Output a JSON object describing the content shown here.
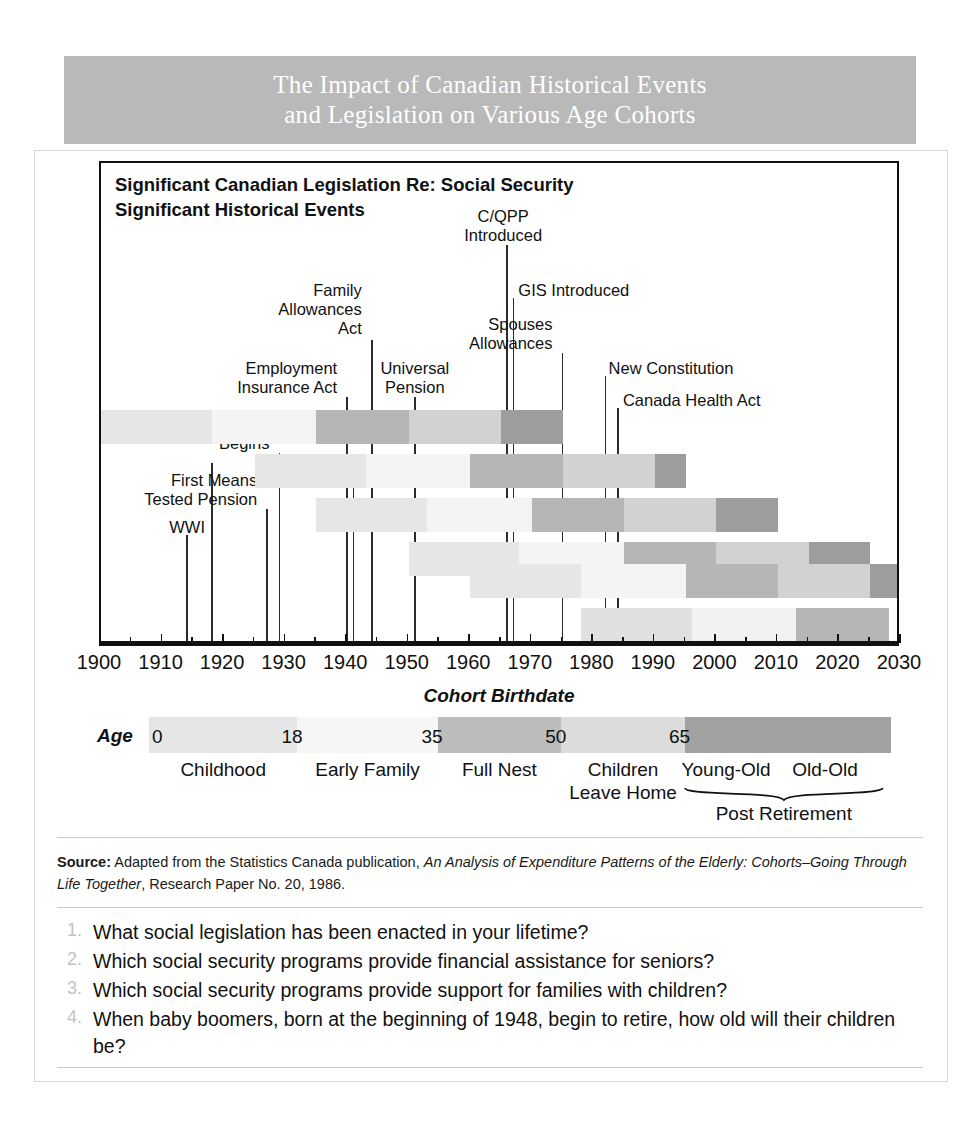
{
  "banner": {
    "line1": "The Impact of Canadian Historical Events",
    "line2": "and Legislation on Various Age Cohorts",
    "bg_color": "#b9b9b9"
  },
  "legend_heading": {
    "line1": "Significant Canadian Legislation Re: Social Security",
    "line2": "Significant Historical Events"
  },
  "chart_data": {
    "type": "bar",
    "title": "The Impact of Canadian Historical Events and Legislation on Various Age Cohorts",
    "xlabel": "Cohort Birthdate",
    "ylabel": "",
    "xlim": [
      1900,
      2030
    ],
    "xticks": [
      1900,
      1910,
      1920,
      1930,
      1940,
      1950,
      1960,
      1970,
      1980,
      1990,
      2000,
      2010,
      2020,
      2030
    ],
    "xticklabels": [
      "1900",
      "1910",
      "1920",
      "1930",
      "1940",
      "1950",
      "1960",
      "1970",
      "1980",
      "1990",
      "2000",
      "2010",
      "2020",
      "2030"
    ],
    "grid": false,
    "legend_position": "below-axis",
    "cohorts": [
      {
        "birth_year": 1900,
        "row": 5,
        "segments": [
          {
            "stage": "Childhood",
            "start": 1900,
            "end": 1918,
            "color": "#e6e6e6"
          },
          {
            "stage": "Early Family",
            "start": 1918,
            "end": 1935,
            "color": "#f4f4f4"
          },
          {
            "stage": "Full Nest",
            "start": 1935,
            "end": 1950,
            "color": "#b6b6b6"
          },
          {
            "stage": "Children Leave Home",
            "start": 1950,
            "end": 1965,
            "color": "#d2d2d2"
          },
          {
            "stage": "Young-Old",
            "start": 1965,
            "end": 1975,
            "color": "#9d9d9d"
          }
        ]
      },
      {
        "birth_year": 1925,
        "row": 4,
        "segments": [
          {
            "stage": "Childhood",
            "start": 1925,
            "end": 1943,
            "color": "#e6e6e6"
          },
          {
            "stage": "Early Family",
            "start": 1943,
            "end": 1960,
            "color": "#f4f4f4"
          },
          {
            "stage": "Full Nest",
            "start": 1960,
            "end": 1975,
            "color": "#b6b6b6"
          },
          {
            "stage": "Children Leave Home",
            "start": 1975,
            "end": 1990,
            "color": "#d2d2d2"
          },
          {
            "stage": "Young-Old",
            "start": 1990,
            "end": 1995,
            "color": "#9d9d9d"
          }
        ]
      },
      {
        "birth_year": 1935,
        "row": 3,
        "segments": [
          {
            "stage": "Childhood",
            "start": 1935,
            "end": 1953,
            "color": "#e6e6e6"
          },
          {
            "stage": "Early Family",
            "start": 1953,
            "end": 1970,
            "color": "#f4f4f4"
          },
          {
            "stage": "Full Nest",
            "start": 1970,
            "end": 1985,
            "color": "#b6b6b6"
          },
          {
            "stage": "Children Leave Home",
            "start": 1985,
            "end": 2000,
            "color": "#d2d2d2"
          },
          {
            "stage": "Young-Old",
            "start": 2000,
            "end": 2010,
            "color": "#9d9d9d"
          }
        ]
      },
      {
        "birth_year": 1950,
        "row": 2,
        "segments": [
          {
            "stage": "Childhood",
            "start": 1950,
            "end": 1968,
            "color": "#e6e6e6"
          },
          {
            "stage": "Early Family",
            "start": 1968,
            "end": 1985,
            "color": "#f4f4f4"
          },
          {
            "stage": "Full Nest",
            "start": 1985,
            "end": 2000,
            "color": "#b6b6b6"
          },
          {
            "stage": "Children Leave Home",
            "start": 2000,
            "end": 2015,
            "color": "#d2d2d2"
          },
          {
            "stage": "Young-Old",
            "start": 2015,
            "end": 2025,
            "color": "#9d9d9d"
          }
        ]
      },
      {
        "birth_year": 1960,
        "row": 1,
        "segments": [
          {
            "stage": "Childhood",
            "start": 1960,
            "end": 1978,
            "color": "#e6e6e6"
          },
          {
            "stage": "Early Family",
            "start": 1978,
            "end": 1995,
            "color": "#f4f4f4"
          },
          {
            "stage": "Full Nest",
            "start": 1995,
            "end": 2010,
            "color": "#b6b6b6"
          },
          {
            "stage": "Children Leave Home",
            "start": 2010,
            "end": 2025,
            "color": "#d2d2d2"
          },
          {
            "stage": "Young-Old",
            "start": 2025,
            "end": 2030,
            "color": "#9d9d9d"
          }
        ]
      },
      {
        "birth_year": 1978,
        "row": 0,
        "segments": [
          {
            "stage": "Childhood",
            "start": 1978,
            "end": 1996,
            "color": "#e0e0e0"
          },
          {
            "stage": "Early Family",
            "start": 1996,
            "end": 2013,
            "color": "#f2f2f2"
          },
          {
            "stage": "Full Nest",
            "start": 2013,
            "end": 2028,
            "color": "#b6b6b6"
          }
        ]
      }
    ],
    "events": [
      {
        "label": "WWI",
        "year": 1914,
        "align": "center",
        "label_lines": [
          "WWI"
        ]
      },
      {
        "label": "WWI end",
        "year": 1918,
        "align": "center",
        "label_lines": []
      },
      {
        "label": "First Means Tested Pension",
        "year": 1927,
        "align": "right",
        "label_lines": [
          "First Means",
          "Tested Pension"
        ]
      },
      {
        "label": "Depression Begins",
        "year": 1929,
        "align": "right",
        "label_lines": [
          "Depression",
          "Begins"
        ]
      },
      {
        "label": "Employment Insurance Act",
        "year": 1940,
        "align": "right",
        "label_lines": [
          "Employment",
          "Insurance Act"
        ]
      },
      {
        "label": "Family Allowances Act",
        "year": 1944,
        "align": "right",
        "label_lines": [
          "Family",
          "Allowances",
          "Act"
        ]
      },
      {
        "label": "WW2",
        "year": 1941,
        "align": "center",
        "label_lines": [
          "WW2"
        ]
      },
      {
        "label": "Universal Pension",
        "year": 1951,
        "align": "center",
        "label_lines": [
          "Universal",
          "Pension"
        ]
      },
      {
        "label": "C/QPP Introduced",
        "year": 1966,
        "align": "center",
        "label_lines": [
          "C/QPP",
          "Introduced"
        ]
      },
      {
        "label": "GIS Introduced",
        "year": 1967,
        "align": "left",
        "label_lines": [
          "GIS Introduced"
        ]
      },
      {
        "label": "Spouses Allowances",
        "year": 1975,
        "align": "right",
        "label_lines": [
          "Spouses",
          "Allowances"
        ]
      },
      {
        "label": "New Constitution",
        "year": 1982,
        "align": "left",
        "label_lines": [
          "New Constitution"
        ]
      },
      {
        "label": "Canada Health Act",
        "year": 1984,
        "align": "left",
        "label_lines": [
          "Canada Health Act"
        ]
      }
    ],
    "age_scale": {
      "label": "Age",
      "ticks": [
        "0",
        "18",
        "35",
        "50",
        "65"
      ],
      "tick_ages": [
        0,
        18,
        35,
        50,
        65
      ],
      "max_age": 90,
      "segments": [
        {
          "from": 0,
          "to": 18,
          "color": "#e6e6e6"
        },
        {
          "from": 18,
          "to": 35,
          "color": "#f6f6f6"
        },
        {
          "from": 35,
          "to": 50,
          "color": "#bcbcbc"
        },
        {
          "from": 50,
          "to": 65,
          "color": "#dcdcdc"
        },
        {
          "from": 65,
          "to": 90,
          "color": "#a2a2a2"
        }
      ],
      "stages": [
        {
          "name": "Childhood",
          "center_age": 9
        },
        {
          "name": "Early Family",
          "center_age": 26.5
        },
        {
          "name": "Full Nest",
          "center_age": 42.5
        },
        {
          "name": "Children\nLeave Home",
          "center_age": 57.5
        },
        {
          "name": "Young-Old",
          "center_age": 70
        },
        {
          "name": "Old-Old",
          "center_age": 82
        }
      ],
      "brace_label": "Post Retirement"
    }
  },
  "source": {
    "prefix": "Source:",
    "text_before": " Adapted from the Statistics Canada publication, ",
    "italic": "An Analysis of Expenditure Patterns of the Elderly: Cohorts–Going Through Life Together",
    "text_after": ", Research Paper No. 20, 1986."
  },
  "questions": [
    {
      "num": "1.",
      "text": "What social legislation has been enacted in your lifetime?"
    },
    {
      "num": "2.",
      "text": "Which social security programs provide financial assistance for seniors?"
    },
    {
      "num": "3.",
      "text": "Which social security programs provide support for families with children?"
    },
    {
      "num": "4.",
      "text": "When baby boomers, born at the beginning of 1948, begin to retire, how old will their children be?"
    }
  ]
}
